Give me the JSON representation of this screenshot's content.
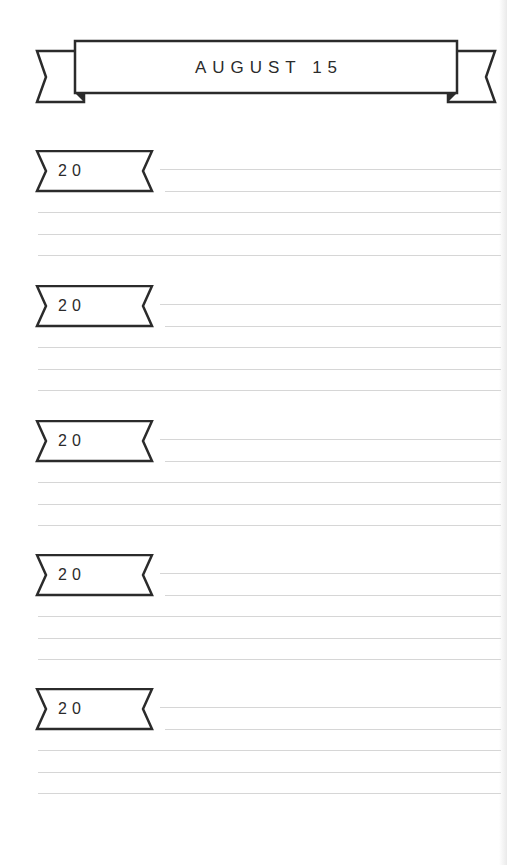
{
  "header": {
    "title": "AUGUST 15"
  },
  "sections": [
    {
      "year_prefix": "20"
    },
    {
      "year_prefix": "20"
    },
    {
      "year_prefix": "20"
    },
    {
      "year_prefix": "20"
    },
    {
      "year_prefix": "20"
    }
  ],
  "colors": {
    "ink": "#2b2b2b",
    "rule": "#d6d6d6",
    "paper": "#ffffff"
  }
}
